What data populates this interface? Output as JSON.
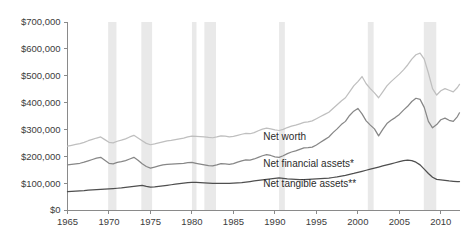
{
  "chart_data": {
    "type": "line",
    "title": "",
    "xlabel": "",
    "ylabel": "",
    "xlim": [
      1965,
      2012.25
    ],
    "ylim": [
      0,
      700000
    ],
    "grid": false,
    "legend_position": "inline-right-of-series",
    "y_ticks": [
      0,
      100000,
      200000,
      300000,
      400000,
      500000,
      600000,
      700000
    ],
    "y_tick_labels": [
      "$0",
      "$100,000",
      "$200,000",
      "$300,000",
      "$400,000",
      "$500,000",
      "$600,000",
      "$700,000"
    ],
    "x_ticks": [
      1965,
      1970,
      1975,
      1980,
      1985,
      1990,
      1995,
      2000,
      2005,
      2010
    ],
    "x_tick_labels": [
      "1965",
      "1970",
      "1975",
      "1980",
      "1985",
      "1990",
      "1995",
      "2000",
      "2005",
      "2010"
    ],
    "shaded_regions_label": "recession bands",
    "shaded_regions": [
      {
        "start": 1969.9,
        "end": 1970.9
      },
      {
        "start": 1973.9,
        "end": 1975.2
      },
      {
        "start": 1980.0,
        "end": 1980.55
      },
      {
        "start": 1981.5,
        "end": 1982.9
      },
      {
        "start": 1990.5,
        "end": 1991.2
      },
      {
        "start": 2001.2,
        "end": 2001.9
      },
      {
        "start": 2007.95,
        "end": 2009.45
      }
    ],
    "series": [
      {
        "name": "Net worth",
        "color": "#bfbfbf",
        "label": "Net worth",
        "label_x": 1988.6,
        "label_y": 262000,
        "x": [
          1965,
          1965.5,
          1966,
          1966.5,
          1967,
          1967.5,
          1968,
          1968.5,
          1969,
          1969.5,
          1970,
          1970.5,
          1971,
          1971.5,
          1972,
          1972.5,
          1973,
          1973.5,
          1974,
          1974.5,
          1975,
          1975.5,
          1976,
          1976.5,
          1977,
          1977.5,
          1978,
          1978.5,
          1979,
          1979.5,
          1980,
          1980.5,
          1981,
          1981.5,
          1982,
          1982.5,
          1983,
          1983.5,
          1984,
          1984.5,
          1985,
          1985.5,
          1986,
          1986.5,
          1987,
          1987.5,
          1988,
          1988.5,
          1989,
          1989.5,
          1990,
          1990.5,
          1991,
          1991.5,
          1992,
          1992.5,
          1993,
          1993.5,
          1994,
          1994.5,
          1995,
          1995.5,
          1996,
          1996.5,
          1997,
          1997.5,
          1998,
          1998.5,
          1999,
          1999.5,
          2000,
          2000.5,
          2001,
          2001.5,
          2002,
          2002.5,
          2003,
          2003.5,
          2004,
          2004.5,
          2005,
          2005.5,
          2006,
          2006.5,
          2007,
          2007.5,
          2008,
          2008.5,
          2009,
          2009.5,
          2010,
          2010.5,
          2011,
          2011.5,
          2012,
          2012.25
        ],
        "values": [
          238000,
          241000,
          244000,
          247000,
          252000,
          258000,
          263000,
          268000,
          272000,
          262000,
          252000,
          250000,
          256000,
          260000,
          265000,
          272000,
          278000,
          268000,
          258000,
          248000,
          243000,
          246000,
          250000,
          254000,
          257000,
          259000,
          262000,
          265000,
          268000,
          272000,
          275000,
          274000,
          273000,
          272000,
          270000,
          269000,
          272000,
          276000,
          275000,
          272000,
          274000,
          278000,
          282000,
          285000,
          284000,
          288000,
          295000,
          301000,
          305000,
          302000,
          298000,
          296000,
          300000,
          307000,
          312000,
          316000,
          321000,
          326000,
          328000,
          332000,
          340000,
          348000,
          356000,
          364000,
          378000,
          392000,
          406000,
          418000,
          440000,
          462000,
          478000,
          497000,
          470000,
          452000,
          436000,
          418000,
          440000,
          462000,
          478000,
          492000,
          506000,
          522000,
          540000,
          562000,
          578000,
          584000,
          562000,
          510000,
          452000,
          428000,
          444000,
          452000,
          446000,
          440000,
          456000,
          468000
        ]
      },
      {
        "name": "Net financial assets*",
        "color": "#878787",
        "label": "Net financial assets*",
        "label_x": 1988.6,
        "label_y": 160000,
        "x": [
          1965,
          1965.5,
          1966,
          1966.5,
          1967,
          1967.5,
          1968,
          1968.5,
          1969,
          1969.5,
          1970,
          1970.5,
          1971,
          1971.5,
          1972,
          1972.5,
          1973,
          1973.5,
          1974,
          1974.5,
          1975,
          1975.5,
          1976,
          1976.5,
          1977,
          1977.5,
          1978,
          1978.5,
          1979,
          1979.5,
          1980,
          1980.5,
          1981,
          1981.5,
          1982,
          1982.5,
          1983,
          1983.5,
          1984,
          1984.5,
          1985,
          1985.5,
          1986,
          1986.5,
          1987,
          1987.5,
          1988,
          1988.5,
          1989,
          1989.5,
          1990,
          1990.5,
          1991,
          1991.5,
          1992,
          1992.5,
          1993,
          1993.5,
          1994,
          1994.5,
          1995,
          1995.5,
          1996,
          1996.5,
          1997,
          1997.5,
          1998,
          1998.5,
          1999,
          1999.5,
          2000,
          2000.5,
          2001,
          2001.5,
          2002,
          2002.5,
          2003,
          2003.5,
          2004,
          2004.5,
          2005,
          2005.5,
          2006,
          2006.5,
          2007,
          2007.5,
          2008,
          2008.5,
          2009,
          2009.5,
          2010,
          2010.5,
          2011,
          2011.5,
          2012,
          2012.25
        ],
        "values": [
          168000,
          170000,
          172000,
          174000,
          178000,
          183000,
          188000,
          193000,
          196000,
          185000,
          174000,
          172000,
          177000,
          180000,
          184000,
          190000,
          196000,
          185000,
          172000,
          162000,
          156000,
          160000,
          164000,
          168000,
          170000,
          171000,
          172000,
          173000,
          174000,
          176000,
          177000,
          174000,
          171000,
          168000,
          165000,
          164000,
          168000,
          173000,
          172000,
          170000,
          173000,
          178000,
          183000,
          187000,
          186000,
          190000,
          196000,
          202000,
          206000,
          203000,
          198000,
          196000,
          202000,
          210000,
          216000,
          220000,
          226000,
          231000,
          232000,
          234000,
          242000,
          252000,
          262000,
          272000,
          288000,
          302000,
          318000,
          330000,
          352000,
          368000,
          378000,
          358000,
          332000,
          316000,
          302000,
          276000,
          300000,
          322000,
          334000,
          344000,
          356000,
          372000,
          386000,
          404000,
          416000,
          412000,
          382000,
          330000,
          306000,
          318000,
          336000,
          342000,
          334000,
          330000,
          348000,
          362000
        ]
      },
      {
        "name": "Net tangible assets**",
        "color": "#4f4f4f",
        "label": "Net tangible assets**",
        "label_x": 1988.6,
        "label_y": 86000,
        "x": [
          1965,
          1965.5,
          1966,
          1966.5,
          1967,
          1967.5,
          1968,
          1968.5,
          1969,
          1969.5,
          1970,
          1970.5,
          1971,
          1971.5,
          1972,
          1972.5,
          1973,
          1973.5,
          1974,
          1974.5,
          1975,
          1975.5,
          1976,
          1976.5,
          1977,
          1977.5,
          1978,
          1978.5,
          1979,
          1979.5,
          1980,
          1980.5,
          1981,
          1981.5,
          1982,
          1982.5,
          1983,
          1983.5,
          1984,
          1984.5,
          1985,
          1985.5,
          1986,
          1986.5,
          1987,
          1987.5,
          1988,
          1988.5,
          1989,
          1989.5,
          1990,
          1990.5,
          1991,
          1991.5,
          1992,
          1992.5,
          1993,
          1993.5,
          1994,
          1994.5,
          1995,
          1995.5,
          1996,
          1996.5,
          1997,
          1997.5,
          1998,
          1998.5,
          1999,
          1999.5,
          2000,
          2000.5,
          2001,
          2001.5,
          2002,
          2002.5,
          2003,
          2003.5,
          2004,
          2004.5,
          2005,
          2005.5,
          2006,
          2006.5,
          2007,
          2007.5,
          2008,
          2008.5,
          2009,
          2009.5,
          2010,
          2010.5,
          2011,
          2011.5,
          2012,
          2012.25
        ],
        "values": [
          68000,
          69000,
          70000,
          71000,
          72000,
          74000,
          75000,
          76000,
          77000,
          78000,
          79000,
          80000,
          81000,
          82000,
          84000,
          86000,
          88000,
          90000,
          92000,
          88000,
          85000,
          86000,
          88000,
          90000,
          92000,
          94000,
          96000,
          98000,
          100000,
          102000,
          103000,
          103000,
          102000,
          101000,
          100000,
          99000,
          99000,
          99000,
          99000,
          99000,
          100000,
          101000,
          102000,
          104000,
          106000,
          108000,
          110000,
          112000,
          114000,
          116000,
          118000,
          120000,
          118000,
          116000,
          115000,
          114000,
          113000,
          113000,
          114000,
          115000,
          116000,
          117000,
          118000,
          119000,
          121000,
          123000,
          126000,
          129000,
          133000,
          136000,
          140000,
          144000,
          148000,
          152000,
          156000,
          160000,
          164000,
          168000,
          172000,
          176000,
          180000,
          184000,
          186000,
          184000,
          178000,
          168000,
          152000,
          136000,
          122000,
          114000,
          112000,
          110000,
          108000,
          107000,
          106000,
          106000
        ]
      }
    ]
  }
}
